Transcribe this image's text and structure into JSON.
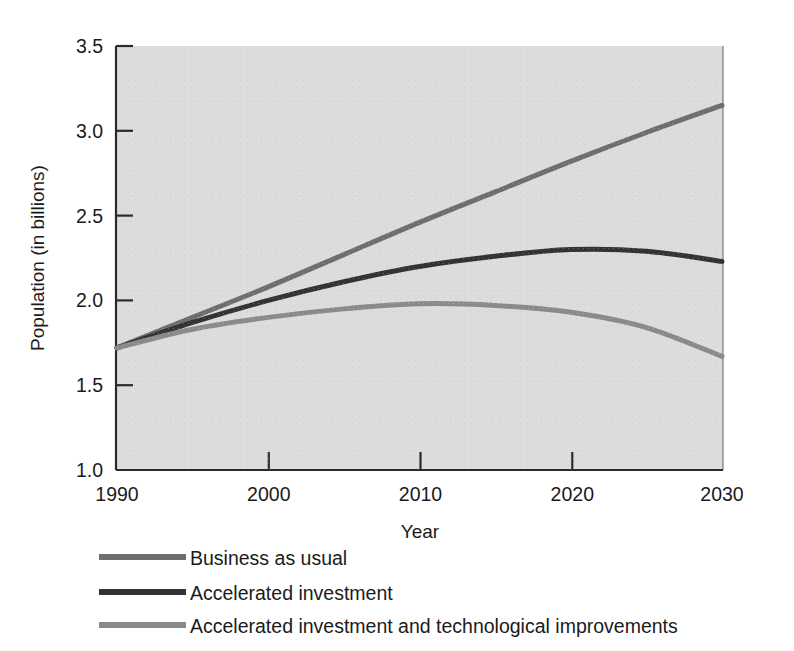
{
  "chart_data": {
    "type": "line",
    "title": "",
    "xlabel": "Year",
    "ylabel": "Population (in billions)",
    "xlim": [
      1990,
      2030
    ],
    "ylim": [
      1.0,
      3.5
    ],
    "xticks": [
      "1990",
      "2000",
      "2010",
      "2020",
      "2030"
    ],
    "yticks": [
      "1.0",
      "1.5",
      "2.0",
      "2.5",
      "3.0",
      "3.5"
    ],
    "grid": false,
    "legend_position": "below-left",
    "panel_color": "#dcdcdc",
    "x": [
      1990,
      1995,
      2000,
      2005,
      2010,
      2015,
      2020,
      2025,
      2030
    ],
    "series": [
      {
        "name": "Business as usual",
        "color": "#6e6e6e",
        "values": [
          1.72,
          1.9,
          2.08,
          2.27,
          2.46,
          2.64,
          2.82,
          2.99,
          3.15
        ]
      },
      {
        "name": "Accelerated investment",
        "color": "#333333",
        "values": [
          1.72,
          1.87,
          2.0,
          2.11,
          2.2,
          2.26,
          2.3,
          2.29,
          2.23
        ]
      },
      {
        "name": "Accelerated investment and technological improvements",
        "color": "#8a8a8a",
        "values": [
          1.72,
          1.83,
          1.9,
          1.95,
          1.98,
          1.97,
          1.93,
          1.84,
          1.67
        ]
      }
    ]
  },
  "axes": {
    "y_title": "Population (in billions)",
    "x_title": "Year",
    "y_tick_labels": [
      "3.5",
      "3.0",
      "2.5",
      "2.0",
      "1.5",
      "1.0"
    ],
    "x_tick_labels": [
      "1990",
      "2000",
      "2010",
      "2020",
      "2030"
    ]
  },
  "legend": {
    "entries": [
      {
        "label": "Business as usual",
        "color": "#6e6e6e"
      },
      {
        "label": "Accelerated investment",
        "color": "#333333"
      },
      {
        "label": "Accelerated investment and technological improvements",
        "color": "#8a8a8a"
      }
    ]
  }
}
